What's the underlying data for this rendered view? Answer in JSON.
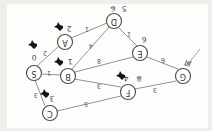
{
  "figure": {
    "kind": "hand-drawn-graph-diagram",
    "orientation": "upside-down",
    "paper_color": "#fdfdfb",
    "ink_color": "#4a4a4a",
    "blot_color": "#141414"
  },
  "nodes": [
    {
      "id": "S",
      "label": "S",
      "x": 178,
      "y": 58,
      "distance": "0",
      "dist_x": 178,
      "dist_y": 74,
      "struck": "",
      "blot_x": 178,
      "blot_y": 88
    },
    {
      "id": "C",
      "label": "C",
      "x": 162,
      "y": 18,
      "distance": "3",
      "dist_x": 160,
      "dist_y": 33,
      "struck": "",
      "blot_x": 166,
      "blot_y": 39
    },
    {
      "id": "B",
      "label": "B",
      "x": 144,
      "y": 55,
      "distance": "1",
      "dist_x": 142,
      "dist_y": 70,
      "struck": "",
      "blot_x": 152,
      "blot_y": 71
    },
    {
      "id": "A",
      "label": "A",
      "x": 147,
      "y": 89,
      "distance": "2",
      "dist_x": 143,
      "dist_y": 103,
      "struck": "",
      "blot_x": 152,
      "blot_y": 106
    },
    {
      "id": "F",
      "label": "F",
      "x": 84,
      "y": 39,
      "distance": "4",
      "dist_x": 80,
      "dist_y": 53,
      "struck": "8",
      "blot_x": 90,
      "blot_y": 57
    },
    {
      "id": "G",
      "label": "G",
      "x": 29,
      "y": 55,
      "distance": "7",
      "dist_x": 26,
      "dist_y": 69,
      "struck": "",
      "blot_x": 20,
      "blot_y": 77
    },
    {
      "id": "E",
      "label": "E",
      "x": 72,
      "y": 78,
      "distance": "6",
      "dist_x": 68,
      "dist_y": 92,
      "struck": "",
      "blot_x": 0,
      "blot_y": 0
    },
    {
      "id": "D",
      "label": "D",
      "x": 98,
      "y": 110,
      "distance": "5",
      "dist_x": 92,
      "dist_y": 123,
      "struck": "6",
      "blot_x": 0,
      "blot_y": 0
    }
  ],
  "edges": [
    {
      "from": "G",
      "to": "F",
      "weight": "3",
      "wx": 57,
      "wy": 41
    },
    {
      "from": "G",
      "to": "E",
      "weight": "6",
      "wx": 49,
      "wy": 71
    },
    {
      "from": "E",
      "to": "B",
      "weight": "8",
      "wx": 113,
      "wy": 70
    },
    {
      "from": "E",
      "to": "D",
      "weight": "1",
      "wx": 83,
      "wy": 97
    },
    {
      "from": "F",
      "to": "B",
      "weight": "3",
      "wx": 113,
      "wy": 45
    },
    {
      "from": "F",
      "to": "C",
      "weight": "5",
      "wx": 126,
      "wy": 27
    },
    {
      "from": "C",
      "to": "S",
      "weight": "3",
      "wx": 176,
      "wy": 36
    },
    {
      "from": "B",
      "to": "S",
      "weight": "1",
      "wx": 163,
      "wy": 58
    },
    {
      "from": "B",
      "to": "D",
      "weight": "4",
      "wx": 121,
      "wy": 85
    },
    {
      "from": "D",
      "to": "A",
      "weight": "1",
      "wx": 125,
      "wy": 102
    },
    {
      "from": "A",
      "to": "S",
      "weight": "2",
      "wx": 167,
      "wy": 78
    }
  ],
  "annotations": {
    "pointer_arrow": "arrow-pointing-to-G",
    "source_node": "S",
    "start_distance": "0"
  }
}
